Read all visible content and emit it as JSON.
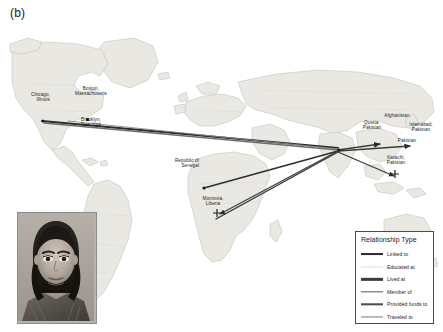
{
  "figure": {
    "panel_label": "(b)",
    "type": "geographic-network-map",
    "background_color": "#ffffff"
  },
  "map": {
    "name": "world-map",
    "land_color": "#e9e7e2",
    "border_color": "#b4b0a8",
    "ocean_color": "#ffffff",
    "projection_hint": "equirectangular-world"
  },
  "locations": [
    {
      "id": "chicago",
      "label": "Chicago,\nIllinois",
      "x": 33,
      "y": 94,
      "align": "right",
      "marker": "none"
    },
    {
      "id": "boston",
      "label": "Boston,\nMassachusetts",
      "x": 85,
      "y": 88,
      "align": "center",
      "marker": "dot"
    },
    {
      "id": "brooklyn",
      "label": "Brooklyn,\nNew York",
      "x": 85,
      "y": 119,
      "align": "center",
      "marker": "none"
    },
    {
      "id": "senegal",
      "label": "Republic of\nSenegal",
      "x": 192,
      "y": 160,
      "align": "right",
      "marker": "dot"
    },
    {
      "id": "liberia",
      "label": "Monrovia,\nLiberia",
      "x": 205,
      "y": 197,
      "align": "center",
      "marker": "cross"
    },
    {
      "id": "afghanistan",
      "label": "Afghanistan",
      "x": 392,
      "y": 116,
      "align": "center",
      "marker": "none"
    },
    {
      "id": "quetta",
      "label": "Quetta,\nPakistan",
      "x": 370,
      "y": 121,
      "align": "center",
      "marker": "none"
    },
    {
      "id": "islamabad",
      "label": "Islamabad,\nPakistan",
      "x": 414,
      "y": 125,
      "align": "center",
      "marker": "none"
    },
    {
      "id": "pakistan",
      "label": "Pakistan",
      "x": 402,
      "y": 139,
      "align": "center",
      "marker": "none"
    },
    {
      "id": "karachi",
      "label": "Karachi,\nPakistan",
      "x": 390,
      "y": 157,
      "align": "center",
      "marker": "cross"
    }
  ],
  "connections": [
    {
      "from": "chicago",
      "to": "pakistan-hub",
      "relationship": "Linked to"
    },
    {
      "from": "boston",
      "to": "pakistan-hub",
      "relationship": "Traveled to"
    },
    {
      "from": "brooklyn",
      "to": "pakistan-hub",
      "relationship": "Lived at"
    },
    {
      "from": "senegal",
      "to": "pakistan-hub",
      "relationship": "Traveled to"
    },
    {
      "from": "liberia",
      "to": "pakistan-hub",
      "relationship": "Traveled to"
    },
    {
      "from": "pakistan-hub",
      "to": "quetta",
      "relationship": "Member of"
    },
    {
      "from": "pakistan-hub",
      "to": "islamabad",
      "relationship": "Provided funds to"
    },
    {
      "from": "pakistan-hub",
      "to": "karachi",
      "relationship": "Traveled to"
    }
  ],
  "legend": {
    "title": "Relationship Type",
    "items": [
      {
        "label": "Linked to",
        "color": "#2b2b2b",
        "width": 1.9
      },
      {
        "label": "Educated at",
        "color": "#dcdcdc",
        "width": 1.1
      },
      {
        "label": "Lived at",
        "color": "#3c3c3c",
        "width": 2.3
      },
      {
        "label": "Member of",
        "color": "#5a5a5a",
        "width": 1.4
      },
      {
        "label": "Provided funds to",
        "color": "#4a4a4a",
        "width": 1.4
      },
      {
        "label": "Traveled to",
        "color": "#7a7a7a",
        "width": 1.1
      }
    ]
  },
  "photo_inset": {
    "name": "portrait-photograph",
    "description": "Grayscale portrait photograph of a person facing the camera",
    "border_color": "#8d8d8d"
  }
}
